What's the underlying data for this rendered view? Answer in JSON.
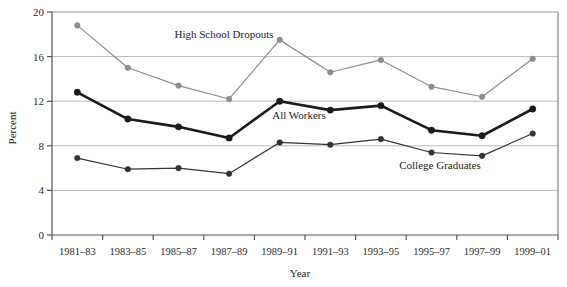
{
  "chart_data": {
    "type": "line",
    "title": "",
    "xlabel": "Year",
    "ylabel": "Percent",
    "categories": [
      "1981–83",
      "1983–85",
      "1985–87",
      "1987–89",
      "1989–91",
      "1991–93",
      "1993–95",
      "1995–97",
      "1997–99",
      "1999–01"
    ],
    "ylim": [
      0,
      20
    ],
    "yticks": [
      0,
      4,
      8,
      12,
      16,
      20
    ],
    "ytick_labels": [
      "0",
      "4",
      "8",
      "12",
      "16",
      "20"
    ],
    "grid": "horizontal",
    "legend_position": "inline-annotations",
    "series": [
      {
        "name": "High School Dropouts",
        "color": "#8c8c8c",
        "marker": "circle",
        "line_width": 1.2,
        "values": [
          18.8,
          15.0,
          13.4,
          12.2,
          17.5,
          14.6,
          15.7,
          13.3,
          12.4,
          15.8
        ]
      },
      {
        "name": "All Workers",
        "color": "#1a1a1a",
        "marker": "circle",
        "line_width": 2.6,
        "values": [
          12.8,
          10.4,
          9.7,
          8.7,
          12.0,
          11.2,
          11.6,
          9.4,
          8.9,
          11.3
        ]
      },
      {
        "name": "College Graduates",
        "color": "#333333",
        "marker": "circle",
        "line_width": 1.2,
        "values": [
          6.9,
          5.9,
          6.0,
          5.5,
          8.3,
          8.1,
          8.6,
          7.4,
          7.1,
          9.1
        ]
      }
    ],
    "annotations": [
      {
        "text": "High School Dropouts",
        "x_px": 224,
        "y_px": 38
      },
      {
        "text": "All Workers",
        "x_px": 299,
        "y_px": 119
      },
      {
        "text": "College Graduates",
        "x_px": 440,
        "y_px": 169
      }
    ]
  }
}
